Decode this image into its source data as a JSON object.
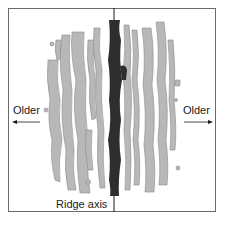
{
  "diagram": {
    "left_label": "Older",
    "right_label": "Older",
    "axis_label": "Ridge axis",
    "left_arrow": "arrow-left",
    "right_arrow": "arrow-right",
    "colors": {
      "frame": "#6b6b6b",
      "stripe_fill": "#b8b8b8",
      "stripe_outline": "#8a8a8a",
      "axis_band": "#2e2e2e",
      "text": "#1a1a1a"
    }
  }
}
